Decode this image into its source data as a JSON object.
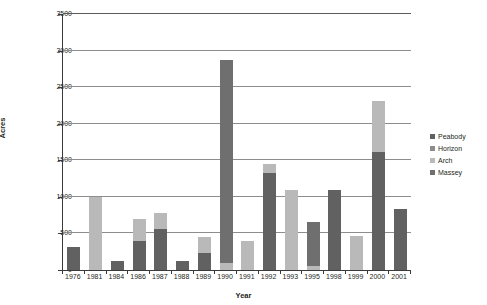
{
  "chart_data": {
    "type": "bar",
    "stacked": true,
    "title": "",
    "xlabel": "Year",
    "ylabel": "Acres",
    "ylim": [
      0,
      3500
    ],
    "ytick_values": [
      0,
      500,
      1000,
      1500,
      2000,
      2500,
      3000,
      3500
    ],
    "ytick_labels": [
      "0",
      "500",
      "1000",
      "1500",
      "2000",
      "2500",
      "3000",
      "3500"
    ],
    "grid": "horizontal",
    "legend_position": "right",
    "categories": [
      "1976",
      "1981",
      "1984",
      "1986",
      "1987",
      "1988",
      "1989",
      "1990",
      "1991",
      "1992",
      "1993",
      "1995",
      "1998",
      "1999",
      "2000",
      "2001"
    ],
    "series": [
      {
        "name": "Peabody",
        "color": "#616161",
        "values": [
          310,
          0,
          130,
          400,
          560,
          130,
          230,
          0,
          0,
          1320,
          0,
          0,
          1090,
          0,
          1620,
          830
        ]
      },
      {
        "name": "Horizon",
        "color": "#8c8c8c",
        "values": [
          0,
          0,
          0,
          0,
          0,
          0,
          0,
          0,
          0,
          0,
          0,
          0,
          0,
          0,
          0,
          0
        ]
      },
      {
        "name": "Arch",
        "color": "#b9b9b9",
        "values": [
          0,
          1000,
          0,
          300,
          220,
          0,
          220,
          100,
          390,
          130,
          1100,
          50,
          0,
          470,
          690,
          0
        ]
      },
      {
        "name": "Massey",
        "color": "#6f6f6f",
        "values": [
          0,
          0,
          0,
          0,
          0,
          0,
          0,
          2770,
          0,
          0,
          0,
          610,
          0,
          0,
          0,
          0
        ]
      }
    ],
    "totals": [
      310,
      1000,
      130,
      700,
      780,
      130,
      450,
      2870,
      390,
      1450,
      1100,
      660,
      1090,
      470,
      2310,
      830
    ]
  },
  "legend": {
    "items": [
      {
        "label": "Peabody"
      },
      {
        "label": "Horizon"
      },
      {
        "label": "Arch"
      },
      {
        "label": "Massey"
      }
    ]
  }
}
